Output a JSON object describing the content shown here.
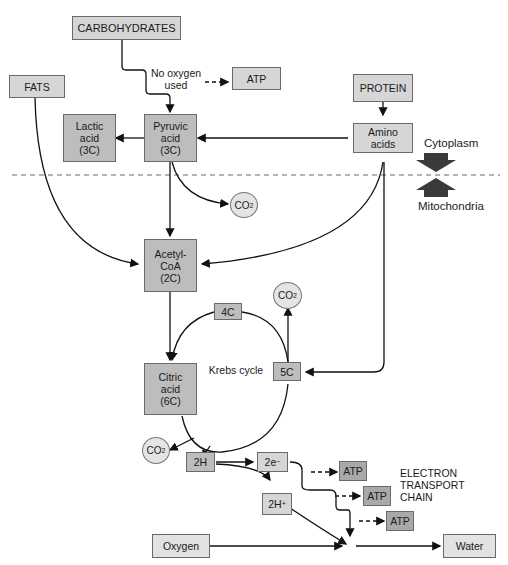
{
  "diagram": {
    "title": "",
    "nodes": {
      "carbohydrates": "CARBOHYDRATES",
      "fats": "FATS",
      "protein": "PROTEIN",
      "atp_anaerobic": "ATP",
      "lactic_acid": "Lactic\nacid\n(3C)",
      "pyruvic_acid": "Pyruvic\nacid\n(3C)",
      "amino_acids": "Amino\nacids",
      "acetyl_coa": "Acetyl-\nCoA\n(2C)",
      "four_c": "4C",
      "five_c": "5C",
      "citric_acid": "Citric\nacid\n(6C)",
      "two_h": "2H",
      "two_e": "2e",
      "two_e_sup": "−",
      "two_h_plus": "2H",
      "two_h_plus_sup": "+",
      "atp_1": "ATP",
      "atp_2": "ATP",
      "atp_3": "ATP",
      "oxygen": "Oxygen",
      "water": "Water"
    },
    "co2": {
      "base": "CO",
      "sub": "2"
    },
    "labels": {
      "no_oxygen": "No oxygen\nused",
      "krebs_cycle": "Krebs cycle",
      "etc": "ELECTRON\nTRANSPORT\nCHAIN",
      "cytoplasm": "Cytoplasm",
      "mitochondria": "Mitochondria"
    },
    "colors": {
      "box_light": "#d6d6d6",
      "box_dark": "#a9a9a9",
      "line": "#111111",
      "divider": "#666666",
      "region_arrow": "#3a3a3a"
    }
  }
}
